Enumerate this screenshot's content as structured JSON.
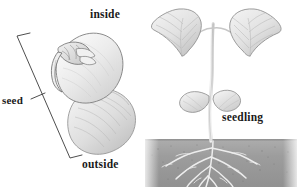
{
  "figure": {
    "background_color": "#ffffff",
    "width": 301,
    "height": 187
  },
  "labels": {
    "inside": "inside",
    "outside": "outside",
    "seed": "seed",
    "seedling": "seedling"
  },
  "colors": {
    "text": "#1a1a1a",
    "line": "#3a3a3a",
    "soil": "#9a9a9a",
    "soil_dark": "#8a8a8a",
    "pencil_light": "#d9d9d9",
    "pencil_mid": "#bdbdbd",
    "pencil_dark": "#8f8f8f",
    "outline": "#6e6e6e"
  },
  "illustration": {
    "left_subject": "bean seed split showing inside cotyledon with embryo and outside seed coat",
    "right_subject": "bean seedling with two leaves, cotyledons, stem and root system in soil",
    "soil_band": "gray speckled horizontal soil layer across lower right"
  }
}
